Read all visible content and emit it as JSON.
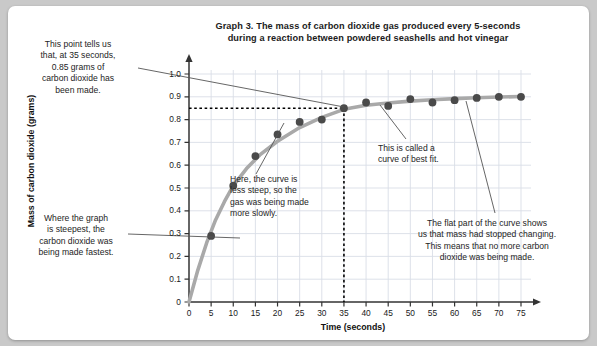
{
  "card": {
    "title_line1": "Graph 3. The mass of carbon dioxide gas produced every 5-seconds",
    "title_line2": "during a reaction between powdered seashells and hot vinegar"
  },
  "annotations": {
    "top_left": "This point tells us that, at 35 seconds, 0.85 grams of carbon dioxide has been made.",
    "top_left_lines": [
      "This point tells us",
      "that, at 35 seconds,",
      "0.85 grams of",
      "carbon dioxide has",
      "been made."
    ],
    "bottom_left": "Where the graph is steepest, the carbon dioxide was being made fastest.",
    "bottom_left_lines": [
      "Where the graph",
      "is steepest, the",
      "carbon dioxide was",
      "being made fastest."
    ],
    "middle": "Here, the curve is less steep, so the gas was being made more slowly.",
    "middle_lines": [
      "Here, the curve is",
      "less steep, so the",
      "gas was being made",
      "more slowly."
    ],
    "best_fit": "This is called a curve of best fit.",
    "best_fit_lines": [
      "This is called a",
      "curve of best fit."
    ],
    "flat_part": "The flat part of the curve shows us that mass had stopped changing. This means that no more carbon dioxide was being made.",
    "flat_part_lines": [
      "The flat part of the curve shows",
      "us that mass had stopped changing.",
      "This means that no more carbon",
      "dioxide was being made."
    ]
  },
  "colors": {
    "curve": "#a9a9a9",
    "point": "#4a4a4a",
    "grid": "#d9dee6",
    "axis": "#333333",
    "guide": "#000000",
    "leader": "#555555",
    "card_bg": "#ffffff",
    "page_bg": "#c9c9c9"
  },
  "chart_data": {
    "type": "scatter",
    "title": "Graph 3. The mass of carbon dioxide gas produced every 5-seconds during a reaction between powdered seashells and hot vinegar",
    "xlabel": "Time (seconds)",
    "ylabel": "Mass of carbon dioxide (grams)",
    "xlim": [
      0,
      75
    ],
    "ylim": [
      0,
      1.0
    ],
    "xticks": [
      0,
      5,
      10,
      15,
      20,
      25,
      30,
      35,
      40,
      45,
      50,
      55,
      60,
      65,
      70,
      75
    ],
    "xtick_labels": [
      "0",
      "5",
      "10",
      "15",
      "20",
      "25",
      "30",
      "35",
      "40",
      "45",
      "50",
      "55",
      "60",
      "65",
      "70",
      "75"
    ],
    "yticks": [
      0,
      0.1,
      0.2,
      0.3,
      0.4,
      0.5,
      0.6,
      0.7,
      0.8,
      0.9,
      1.0
    ],
    "ytick_labels": [
      "0",
      "0.1",
      "0.2",
      "0.3",
      "0.4",
      "0.5",
      "0.6",
      "0.7",
      "0.8",
      "0.9",
      "1.0"
    ],
    "grid": true,
    "legend": null,
    "x": [
      0,
      5,
      10,
      15,
      20,
      25,
      30,
      35,
      40,
      45,
      50,
      55,
      60,
      65,
      70,
      75
    ],
    "values": [
      0.0,
      0.29,
      0.51,
      0.64,
      0.735,
      0.79,
      0.8,
      0.85,
      0.875,
      0.86,
      0.89,
      0.875,
      0.885,
      0.895,
      0.9,
      0.9
    ],
    "series": [
      {
        "name": "Mass of carbon dioxide",
        "values": [
          0.0,
          0.29,
          0.51,
          0.64,
          0.735,
          0.79,
          0.8,
          0.85,
          0.875,
          0.86,
          0.89,
          0.875,
          0.885,
          0.895,
          0.9,
          0.9
        ]
      }
    ],
    "fit_curve": {
      "name": "curve of best fit",
      "x": [
        0,
        2,
        4,
        6,
        8,
        10,
        13,
        16,
        20,
        25,
        30,
        35,
        40,
        45,
        50,
        55,
        60,
        65,
        70,
        75
      ],
      "y": [
        0.0,
        0.14,
        0.26,
        0.36,
        0.44,
        0.51,
        0.585,
        0.645,
        0.705,
        0.765,
        0.81,
        0.845,
        0.863,
        0.873,
        0.881,
        0.887,
        0.892,
        0.896,
        0.899,
        0.901
      ]
    },
    "guides": {
      "horizontal_value": 0.85,
      "vertical_value": 35,
      "style": "dotted"
    }
  }
}
